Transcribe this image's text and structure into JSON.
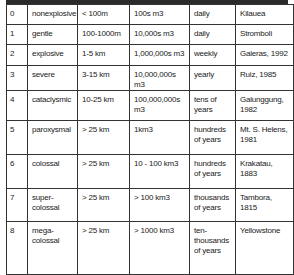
{
  "table": {
    "columns": [
      "VEI",
      "description",
      "plume height",
      "volume",
      "frequency",
      "example"
    ],
    "rows": [
      {
        "vei": "0",
        "description": "nonexplosive",
        "plume": "< 100m",
        "volume": "100s m3",
        "frequency": "daily",
        "example": "Kilauea"
      },
      {
        "vei": "1",
        "description": "gentle",
        "plume": "100-1000m",
        "volume": "10,000s m3",
        "frequency": "daily",
        "example": "Stromboli"
      },
      {
        "vei": "2",
        "description": "explosive",
        "plume": "1-5 km",
        "volume": "1,000,000s m3",
        "frequency": "weekly",
        "example": "Galeras, 1992"
      },
      {
        "vei": "3",
        "description": "severe",
        "plume": "3-15 km",
        "volume": "10,000,000s m3",
        "frequency": "yearly",
        "example": "Ruiz, 1985"
      },
      {
        "vei": "4",
        "description": "cataclysmic",
        "plume": "10-25 km",
        "volume": "100,000,000s m3",
        "frequency": "tens of years",
        "example": "Galunggung, 1982"
      },
      {
        "vei": "5",
        "description": "paroxysmal",
        "plume": "> 25 km",
        "volume": "1km3",
        "frequency": "hundreds of years",
        "example": "Mt. S. Helens, 1981"
      },
      {
        "vei": "6",
        "description": "colossal",
        "plume": "> 25 km",
        "volume": "10 - 100 km3",
        "frequency": "hundreds of years",
        "example": "Krakatau, 1883"
      },
      {
        "vei": "7",
        "description": "super-colossal",
        "plume": "> 25 km",
        "volume": "> 100 km3",
        "frequency": "thousands of years",
        "example": "Tambora, 1815"
      },
      {
        "vei": "8",
        "description": "mega-colossal",
        "plume": "> 25 km",
        "volume": "> 1000 km3",
        "frequency": "ten-thousands of years",
        "example": "Yellowstone"
      }
    ]
  },
  "colors": {
    "header_bar": "#2a2a2a",
    "border": "#333333",
    "text": "#1a1a1a",
    "background": "#ffffff"
  }
}
